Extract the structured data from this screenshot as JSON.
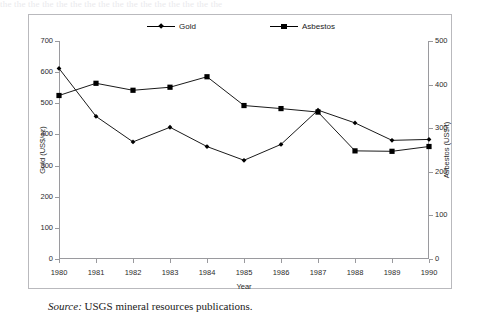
{
  "top_bleed_text": "the the the the the the the the the the the the the the the the",
  "caption": {
    "source_label": "Source:",
    "text": " USGS mineral resources publications."
  },
  "chart_data": {
    "type": "line",
    "title": "",
    "xlabel": "Year",
    "ylabel": "Gold (US$/oz)",
    "y2label": "Asbestos (US$/t)",
    "categories": [
      1980,
      1981,
      1982,
      1983,
      1984,
      1985,
      1986,
      1987,
      1988,
      1989,
      1990
    ],
    "x_tick_labels": [
      "1980",
      "1981",
      "1982",
      "1983",
      "1984",
      "1985",
      "1986",
      "1987",
      "1988",
      "1989",
      "1990"
    ],
    "ylim": [
      0,
      700
    ],
    "y_ticks": [
      0,
      100,
      200,
      300,
      400,
      500,
      600,
      700
    ],
    "y_tick_labels": [
      "0",
      "100",
      "200",
      "300",
      "400",
      "500",
      "600",
      "700"
    ],
    "y2lim": [
      0,
      500
    ],
    "y2_ticks": [
      0,
      100,
      200,
      300,
      400,
      500
    ],
    "y2_tick_labels": [
      "0",
      "100",
      "200",
      "300",
      "400",
      "500"
    ],
    "grid": false,
    "legend_position": "top-center",
    "series": [
      {
        "name": "Gold",
        "axis": "left",
        "marker": "diamond",
        "color": "#000000",
        "values": [
          612,
          458,
          376,
          423,
          361,
          317,
          368,
          478,
          437,
          381,
          384
        ]
      },
      {
        "name": "Asbestos",
        "axis": "right",
        "marker": "square",
        "color": "#000000",
        "values": [
          375,
          403,
          387,
          394,
          418,
          352,
          345,
          337,
          248,
          247,
          258
        ]
      }
    ]
  }
}
